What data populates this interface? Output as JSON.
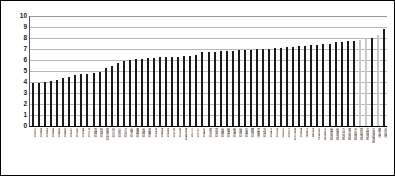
{
  "chart_data": {
    "type": "bar",
    "title": "",
    "subtitle": "",
    "xlabel": "",
    "ylabel": "",
    "ylim": [
      0,
      10
    ],
    "ytick_step": 1,
    "ytick_labels": [
      "10",
      "9",
      "8",
      "7",
      "6",
      "5",
      "4",
      "3",
      "2",
      "1",
      "0"
    ],
    "grid": true,
    "grid_axis": "y",
    "legend": "none",
    "sorted": "ascending",
    "bar_colors": {
      "default": "#1b1b1b",
      "highlight": "#c9c9c9"
    },
    "categories": [
      "沖縄県",
      "鳥取県",
      "高知県",
      "島根県",
      "徳島県",
      "佐賀県",
      "山梨県",
      "福井県",
      "富山県",
      "香川県",
      "宮崎県",
      "秋田県",
      "和歌山県",
      "石川県",
      "山形県",
      "大分県",
      "岩手県",
      "青森県",
      "長崎県",
      "滋賀県",
      "奈良県",
      "愛媛県",
      "群馬県",
      "岡山県",
      "熊本県",
      "鹿児島県",
      "三重県",
      "山口県",
      "福島県",
      "栃木県",
      "宮城県",
      "長野県",
      "岐阜県",
      "新潟県",
      "福岡県",
      "広島県",
      "静岡県",
      "京都府",
      "茨城県",
      "千葉県",
      "埼玉県",
      "北海道",
      "兵庫県",
      "神奈川県",
      "愛知県",
      "大阪府",
      "東京都",
      "全国平均",
      "中部地区",
      "関西地区",
      "関東地区",
      "九州地区",
      "東北地区",
      "中国地区",
      "四国地区",
      "北陸地区",
      "北海道地区",
      "最大値",
      "合計値"
    ],
    "values": [
      3.9,
      3.9,
      4.0,
      4.1,
      4.2,
      4.4,
      4.5,
      4.6,
      4.7,
      4.7,
      4.8,
      4.9,
      5.3,
      5.5,
      5.7,
      5.9,
      6.0,
      6.1,
      6.1,
      6.2,
      6.2,
      6.3,
      6.3,
      6.3,
      6.3,
      6.4,
      6.4,
      6.5,
      6.7,
      6.7,
      6.7,
      6.8,
      6.8,
      6.8,
      6.9,
      6.9,
      6.9,
      7.0,
      7.0,
      7.0,
      7.1,
      7.1,
      7.2,
      7.2,
      7.3,
      7.3,
      7.4,
      7.4,
      7.5,
      7.5,
      7.6,
      7.6,
      7.7,
      7.7,
      7.8,
      7.9,
      8.0,
      8.3,
      8.8
    ],
    "highlight_indices": [
      54,
      55,
      57
    ],
    "bar_count": 59
  }
}
